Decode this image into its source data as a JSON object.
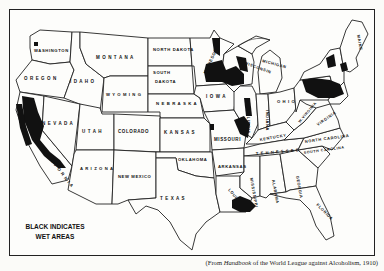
{
  "map": {
    "title": "Wet and dry areas of the United States",
    "legend": {
      "line1": "BLACK INDICATES",
      "line2": "WET AREAS",
      "wet_color": "#111111",
      "dry_color": "#fdfdfb"
    },
    "caption": {
      "prefix": "(From ",
      "source_italic": "Handbook",
      "suffix": " of the World League against Alcoholism, 1910)"
    },
    "state_labels": [
      {
        "id": "washington",
        "label": "WASHINGTON",
        "x": 34,
        "y": 52,
        "size": 4.2,
        "rotate": 0
      },
      {
        "id": "oregon",
        "label": "O R E G O N",
        "x": 24,
        "y": 80,
        "size": 4.5,
        "rotate": 0
      },
      {
        "id": "idaho",
        "label": "I D A H O",
        "x": 70,
        "y": 83,
        "size": 4.5,
        "rotate": 0
      },
      {
        "id": "montana",
        "label": "M O N T A N A",
        "x": 96,
        "y": 59,
        "size": 4.5,
        "rotate": 0
      },
      {
        "id": "wyoming",
        "label": "W Y O M I N G",
        "x": 106,
        "y": 96,
        "size": 4.2,
        "rotate": 0
      },
      {
        "id": "north-dakota",
        "label": "NORTH DAKOTA",
        "x": 153,
        "y": 51,
        "size": 4.2,
        "rotate": 0
      },
      {
        "id": "south-dakota-1",
        "label": "SOUTH",
        "x": 153,
        "y": 74,
        "size": 4.2,
        "rotate": 0
      },
      {
        "id": "south-dakota-2",
        "label": "DAKOTA",
        "x": 155,
        "y": 83,
        "size": 4.2,
        "rotate": 0
      },
      {
        "id": "nebraska",
        "label": "N E B R A S K A",
        "x": 156,
        "y": 105,
        "size": 4.3,
        "rotate": 0
      },
      {
        "id": "nevada",
        "label": "N E V A D A",
        "x": 42,
        "y": 125,
        "size": 4.5,
        "rotate": 0
      },
      {
        "id": "utah",
        "label": "U T A H",
        "x": 82,
        "y": 133,
        "size": 4.5,
        "rotate": 0
      },
      {
        "id": "colorado",
        "label": "COLORADO",
        "x": 118,
        "y": 133,
        "size": 4.5,
        "rotate": 0
      },
      {
        "id": "kansas",
        "label": "K A N S A S",
        "x": 164,
        "y": 134,
        "size": 4.5,
        "rotate": 0
      },
      {
        "id": "california",
        "label": "C A L I F O R N I A",
        "x": 42,
        "y": 150,
        "size": 4.3,
        "rotate": 52
      },
      {
        "id": "arizona",
        "label": "A R I Z O N A",
        "x": 80,
        "y": 170,
        "size": 4.2,
        "rotate": 0
      },
      {
        "id": "new-mexico",
        "label": "NEW MEXICO",
        "x": 118,
        "y": 178,
        "size": 4.2,
        "rotate": 0
      },
      {
        "id": "oklahoma",
        "label": "OKLAHOMA",
        "x": 178,
        "y": 161,
        "size": 4.2,
        "rotate": 0
      },
      {
        "id": "texas",
        "label": "T E X A S",
        "x": 160,
        "y": 200,
        "size": 4.5,
        "rotate": 0
      },
      {
        "id": "iowa",
        "label": "I O W A",
        "x": 206,
        "y": 98,
        "size": 4.5,
        "rotate": 0
      },
      {
        "id": "minnesota",
        "label": "MINNESOTA",
        "x": 206,
        "y": 74,
        "size": 4.2,
        "rotate": -65
      },
      {
        "id": "wisconsin",
        "label": "WISCONSIN",
        "x": 244,
        "y": 64,
        "size": 4.0,
        "rotate": 20
      },
      {
        "id": "michigan",
        "label": "MICHIGAN",
        "x": 262,
        "y": 62,
        "size": 4.0,
        "rotate": 15
      },
      {
        "id": "illinois",
        "label": "ILLINOIS",
        "x": 247,
        "y": 112,
        "size": 4.0,
        "rotate": 90
      },
      {
        "id": "indiana",
        "label": "INDIANA",
        "x": 266,
        "y": 110,
        "size": 4.0,
        "rotate": 90
      },
      {
        "id": "ohio",
        "label": "O H I O",
        "x": 277,
        "y": 103,
        "size": 4.2,
        "rotate": 0
      },
      {
        "id": "missouri",
        "label": "MISSOURI",
        "x": 214,
        "y": 141,
        "size": 4.5,
        "rotate": 0
      },
      {
        "id": "arkansas",
        "label": "ARKANSAS",
        "x": 218,
        "y": 168,
        "size": 4.2,
        "rotate": 0
      },
      {
        "id": "louisiana",
        "label": "LOUISIANA",
        "x": 228,
        "y": 190,
        "size": 4.0,
        "rotate": 50
      },
      {
        "id": "mississippi",
        "label": "MISSISSIPPI",
        "x": 250,
        "y": 178,
        "size": 4.0,
        "rotate": 80
      },
      {
        "id": "alabama",
        "label": "ALABAMA",
        "x": 272,
        "y": 180,
        "size": 4.0,
        "rotate": 80
      },
      {
        "id": "georgia",
        "label": "GEORGIA",
        "x": 296,
        "y": 176,
        "size": 4.0,
        "rotate": 80
      },
      {
        "id": "florida",
        "label": "FLORIDA",
        "x": 316,
        "y": 205,
        "size": 4.0,
        "rotate": 45
      },
      {
        "id": "tennessee",
        "label": "T E N N E S S E E",
        "x": 256,
        "y": 155,
        "size": 4.0,
        "rotate": -5
      },
      {
        "id": "kentucky",
        "label": "KENTUCKY",
        "x": 260,
        "y": 141,
        "size": 4.0,
        "rotate": -10
      },
      {
        "id": "north-carolina",
        "label": "NORTH CAROLINA",
        "x": 305,
        "y": 143,
        "size": 4.0,
        "rotate": -8
      },
      {
        "id": "south-carolina",
        "label": "SOUTH CAROLINA",
        "x": 304,
        "y": 154,
        "size": 3.6,
        "rotate": -8
      },
      {
        "id": "virginia",
        "label": "VIRGINIA",
        "x": 318,
        "y": 126,
        "size": 4.0,
        "rotate": -35
      },
      {
        "id": "west-virginia",
        "label": "W.VIRGINIA",
        "x": 300,
        "y": 123,
        "size": 3.6,
        "rotate": -50
      },
      {
        "id": "maine",
        "label": "MAINE",
        "x": 357,
        "y": 35,
        "size": 4.0,
        "rotate": 80
      }
    ]
  }
}
